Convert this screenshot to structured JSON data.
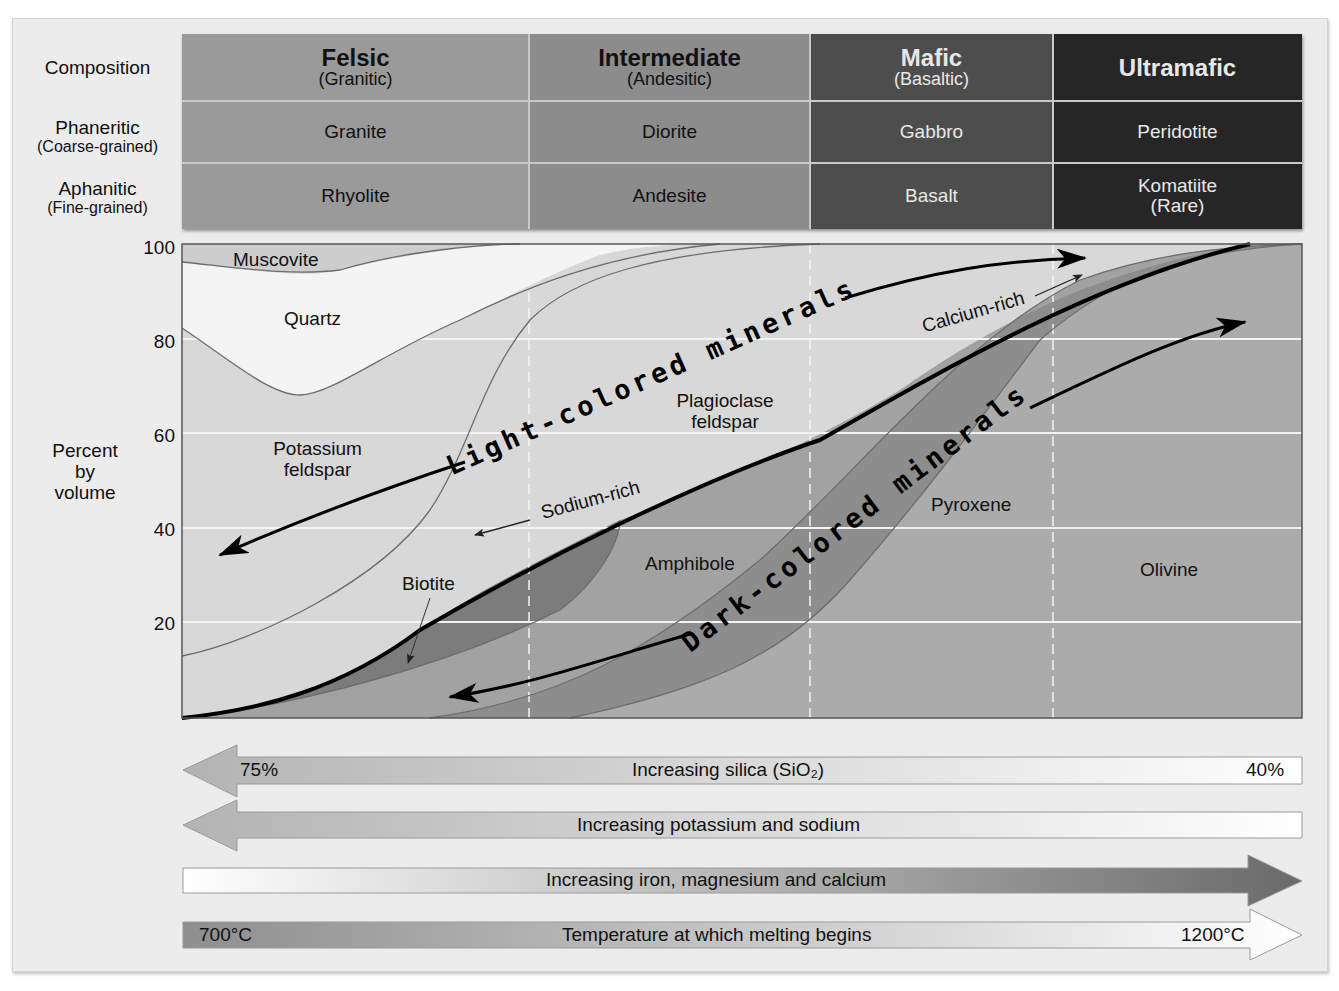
{
  "table": {
    "row_headers": {
      "composition": "Composition",
      "phaneritic": "Phaneritic",
      "phaneritic_sub": "(Coarse-grained)",
      "aphanitic": "Aphanitic",
      "aphanitic_sub": "(Fine-grained)"
    },
    "columns": [
      {
        "name": "Felsic",
        "sub": "(Granitic)",
        "phaneritic": "Granite",
        "aphanitic": "Rhyolite",
        "color": "#9a9a9a"
      },
      {
        "name": "Intermediate",
        "sub": "(Andesitic)",
        "phaneritic": "Diorite",
        "aphanitic": "Andesite",
        "color": "#8c8c8c"
      },
      {
        "name": "Mafic",
        "sub": "(Basaltic)",
        "phaneritic": "Gabbro",
        "aphanitic": "Basalt",
        "color": "#4d4d4d"
      },
      {
        "name": "Ultramafic",
        "sub": "",
        "phaneritic": "Peridotite",
        "aphanitic": "Komatiite",
        "aphanitic_sub": "(Rare)",
        "color": "#262626"
      }
    ]
  },
  "chart": {
    "ylabel": "Percent by volume",
    "ylabel_lines": [
      "Percent",
      "by",
      "volume"
    ],
    "yticks": [
      "100",
      "80",
      "60",
      "40",
      "20"
    ],
    "minerals": {
      "muscovite": "Muscovite",
      "quartz": "Quartz",
      "potassium_feldspar_1": "Potassium",
      "potassium_feldspar_2": "feldspar",
      "plagioclase_1": "Plagioclase",
      "plagioclase_2": "feldspar",
      "biotite": "Biotite",
      "amphibole": "Amphibole",
      "pyroxene": "Pyroxene",
      "olivine": "Olivine"
    },
    "annotations": {
      "light": "Light-colored minerals",
      "dark": "Dark-colored minerals",
      "sodium_rich": "Sodium-rich",
      "calcium_rich": "Calcium-rich"
    }
  },
  "gradients": [
    {
      "label": "Increasing silica (SiO₂)",
      "left": "75%",
      "right": "40%",
      "direction": "left"
    },
    {
      "label": "Increasing potassium and sodium",
      "left": "",
      "right": "",
      "direction": "left"
    },
    {
      "label": "Increasing iron, magnesium and calcium",
      "left": "",
      "right": "",
      "direction": "right"
    },
    {
      "label": "Temperature at which melting begins",
      "left": "700°C",
      "right": "1200°C",
      "direction": "right"
    }
  ],
  "colors": {
    "panel": "#ececec",
    "felsic": "#9a9a9a",
    "intermediate": "#8c8c8c",
    "mafic": "#4d4d4d",
    "ultramafic": "#262626",
    "light_region": "#d8d8d8",
    "quartz": "#f4f4f4",
    "biotite": "#7c7c7c",
    "amphibole": "#a2a2a2",
    "pyroxene": "#8a8a8a",
    "olivine": "#ababab"
  }
}
